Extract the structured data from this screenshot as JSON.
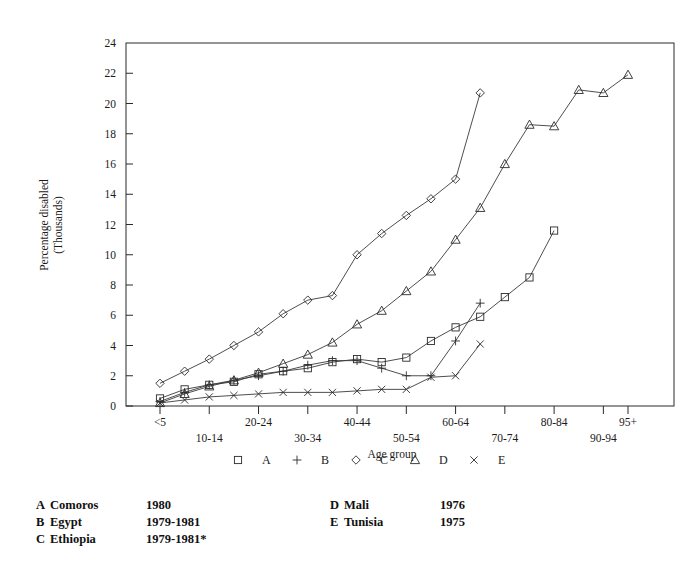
{
  "chart_data": {
    "type": "line",
    "title": "",
    "xlabel": "Age group",
    "ylabel": "Percentage disabled\n(Thousands)",
    "ylabel_line1": "Percentage disabled",
    "ylabel_line2": "(Thousands)",
    "ylim": [
      0,
      24
    ],
    "ytick_step": 2,
    "yticks": [
      0,
      2,
      4,
      6,
      8,
      10,
      12,
      14,
      16,
      18,
      20,
      22,
      24
    ],
    "grid": false,
    "legend_position": "below-axis",
    "categories": [
      "<5",
      "5-9",
      "10-14",
      "15-19",
      "20-24",
      "25-29",
      "30-34",
      "35-39",
      "40-44",
      "45-49",
      "50-54",
      "55-59",
      "60-64",
      "65-69",
      "70-74",
      "75-79",
      "80-84",
      "85-89",
      "90-94",
      "95+"
    ],
    "xtick_labels_upper": [
      "<5",
      "20-24",
      "40-44",
      "60-64",
      "80-84",
      "95+"
    ],
    "xtick_labels_lower": [
      "10-14",
      "30-34",
      "50-54",
      "70-74",
      "90-94"
    ],
    "xtick_labels_all": [
      "<5",
      "10-14",
      "20-24",
      "30-34",
      "40-44",
      "50-54",
      "60-64",
      "70-74",
      "80-84",
      "90-94",
      "95+"
    ],
    "series": [
      {
        "key": "A",
        "name": "Comoros",
        "marker": "square",
        "values": [
          0.5,
          1.1,
          1.4,
          1.6,
          2.1,
          2.3,
          2.5,
          2.9,
          3.1,
          2.9,
          3.2,
          4.3,
          5.2,
          5.9,
          7.2,
          8.5,
          11.6,
          null,
          null,
          null
        ]
      },
      {
        "key": "B",
        "name": "Egypt",
        "marker": "plus",
        "values": [
          0.3,
          0.9,
          1.4,
          1.7,
          2.0,
          2.3,
          2.7,
          3.0,
          3.0,
          2.5,
          2.0,
          2.0,
          4.3,
          6.8,
          null,
          null,
          null,
          null,
          null,
          null
        ]
      },
      {
        "key": "C",
        "name": "Ethiopia",
        "marker": "diamond",
        "values": [
          1.5,
          2.3,
          3.1,
          4.0,
          4.9,
          6.1,
          7.0,
          7.3,
          10.0,
          11.4,
          12.6,
          13.7,
          15.0,
          20.7,
          null,
          null,
          null,
          null,
          null,
          null
        ]
      },
      {
        "key": "D",
        "name": "Mali",
        "marker": "triangle",
        "values": [
          0.2,
          0.8,
          1.3,
          1.7,
          2.2,
          2.8,
          3.4,
          4.2,
          5.4,
          6.3,
          7.6,
          8.9,
          11.0,
          13.1,
          16.0,
          18.6,
          18.5,
          20.9,
          20.7,
          21.9
        ]
      },
      {
        "key": "E",
        "name": "Tunisia",
        "marker": "cross",
        "values": [
          0.2,
          0.4,
          0.6,
          0.7,
          0.8,
          0.9,
          0.9,
          0.9,
          1.0,
          1.1,
          1.1,
          1.9,
          2.0,
          4.1,
          null,
          null,
          null,
          null,
          null,
          null
        ]
      }
    ]
  },
  "legend": {
    "entries": [
      {
        "marker": "square",
        "label": "A"
      },
      {
        "marker": "plus",
        "label": "B"
      },
      {
        "marker": "diamond",
        "label": "C"
      },
      {
        "marker": "triangle",
        "label": "D"
      },
      {
        "marker": "cross",
        "label": "E"
      }
    ]
  },
  "key_table": {
    "left": [
      {
        "letter": "A",
        "country": "Comoros",
        "year": "1980"
      },
      {
        "letter": "B",
        "country": "Egypt",
        "year": "1979-1981"
      },
      {
        "letter": "C",
        "country": "Ethiopia",
        "year": "1979-1981*"
      }
    ],
    "right": [
      {
        "letter": "D",
        "country": "Mali",
        "year": "1976"
      },
      {
        "letter": "E",
        "country": "Tunisia",
        "year": "1975"
      }
    ]
  },
  "colors": {
    "ink": "#1a1a1a",
    "line": "#3a3a3a",
    "background": "#ffffff"
  }
}
